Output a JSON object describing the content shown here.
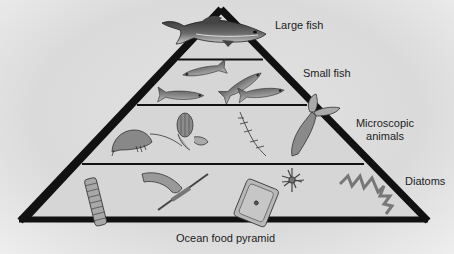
{
  "diagram": {
    "title": "Ocean food pyramid",
    "levels": [
      {
        "rank": 1,
        "label": "Large fish",
        "position": "apex"
      },
      {
        "rank": 2,
        "label": "Small fish",
        "position": "upper-middle"
      },
      {
        "rank": 3,
        "label_line1": "Microscopic",
        "label_line2": "animals",
        "position": "lower-middle"
      },
      {
        "rank": 4,
        "label": "Diatoms",
        "position": "base"
      }
    ],
    "colors": {
      "outline": "#111111",
      "fill": "#d4d4d4",
      "background": "#e2e2e2",
      "text": "#1c1c1c"
    }
  }
}
